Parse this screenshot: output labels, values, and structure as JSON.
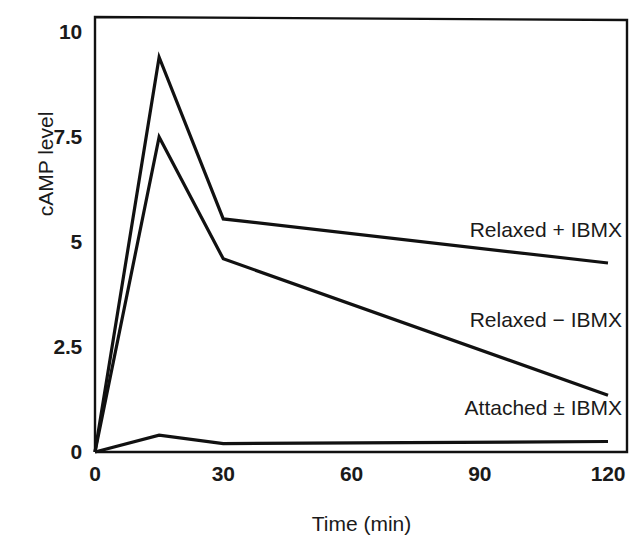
{
  "chart_data": {
    "type": "line",
    "title": "",
    "xlabel": "Time (min)",
    "ylabel": "cAMP level",
    "xlim": [
      0,
      120
    ],
    "ylim": [
      0,
      10
    ],
    "grid": false,
    "legend_position": "inline-annotations",
    "x_ticks": [
      "0",
      "30",
      "60",
      "90",
      "120"
    ],
    "x_tick_values": [
      0,
      30,
      60,
      90,
      120
    ],
    "y_ticks": [
      "0",
      "2.5",
      "5",
      "7.5",
      "10"
    ],
    "y_tick_values": [
      0,
      2.5,
      5,
      7.5,
      10
    ],
    "series": [
      {
        "name": "Relaxed + IBMX",
        "x": [
          0,
          15,
          30,
          120
        ],
        "values": [
          0,
          9.4,
          5.55,
          4.5
        ],
        "label_x": 120,
        "label_y": 5.25
      },
      {
        "name": "Relaxed − IBMX",
        "x": [
          0,
          15,
          30,
          120
        ],
        "values": [
          0,
          7.5,
          4.6,
          1.35
        ],
        "label_x": 120,
        "label_y": 3.1
      },
      {
        "name": "Attached ± IBMX",
        "x": [
          0,
          15,
          30,
          120
        ],
        "values": [
          0,
          0.4,
          0.2,
          0.25
        ],
        "label_x": 120,
        "label_y": 1.0
      }
    ],
    "colors": {
      "line": "#111111",
      "axis": "#111111",
      "background": "#ffffff",
      "text": "#1a1a1a"
    }
  }
}
